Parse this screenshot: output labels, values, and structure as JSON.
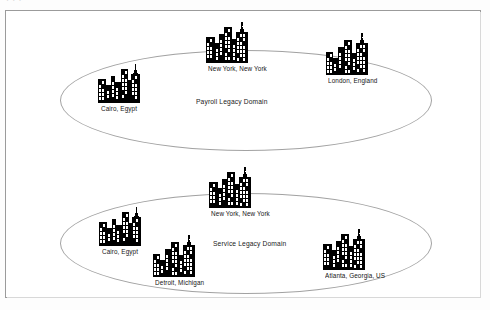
{
  "page": {
    "background_color": "#fdfdfd",
    "frame_border_color": "#9b9b9b",
    "scan_artifact_text": "·        ·   ·"
  },
  "diagram": {
    "type": "domain-topology",
    "ellipse_stroke_color": "#a2a2a2",
    "skyline_color": "#000000",
    "domains": [
      {
        "id": "payroll",
        "label": "Payroll Legacy Domain",
        "label_x": 196,
        "label_y": 97,
        "ellipse": {
          "x": 60,
          "y": 50,
          "width": 372,
          "height": 101
        },
        "cities": [
          {
            "name": "Cairo, Egypt",
            "x": 97,
            "y": 55,
            "variant": "a"
          },
          {
            "name": "New York, New York",
            "x": 205,
            "y": 15,
            "variant": "b"
          },
          {
            "name": "London, England",
            "x": 325,
            "y": 27,
            "variant": "c"
          }
        ]
      },
      {
        "id": "service",
        "label": "Service Legacy Domain",
        "label_x": 213,
        "label_y": 239,
        "ellipse": {
          "x": 60,
          "y": 193,
          "width": 372,
          "height": 101
        },
        "cities": [
          {
            "name": "Cairo, Egypt",
            "x": 98,
            "y": 198,
            "variant": "a"
          },
          {
            "name": "New York, New York",
            "x": 208,
            "y": 160,
            "variant": "b"
          },
          {
            "name": "Detroit, Michigan",
            "x": 152,
            "y": 229,
            "variant": "c"
          },
          {
            "name": "Atlanta, Georgia, US",
            "x": 322,
            "y": 222,
            "variant": "b"
          }
        ]
      }
    ]
  }
}
